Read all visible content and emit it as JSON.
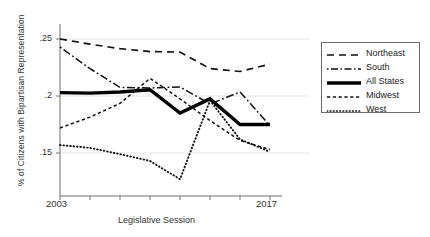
{
  "chart_data": {
    "type": "line",
    "title": "",
    "xlabel": "Legislative Session",
    "ylabel": "% of Citizens with Bipartisan Representation",
    "x": [
      2003,
      2005,
      2007,
      2009,
      2011,
      2013,
      2015,
      2017
    ],
    "xtick_labels": {
      "first": "2003",
      "last": "2017"
    },
    "ytick_labels": [
      ".25",
      ".2",
      ".15"
    ],
    "ytick_values": [
      0.25,
      0.2,
      0.15
    ],
    "ylim": [
      0.118,
      0.262
    ],
    "xlim": [
      2003,
      2017
    ],
    "grid": "horizontal-faint",
    "legend_position": "right-outside",
    "series": [
      {
        "name": "Northeast",
        "style": "dashed",
        "color": "#111111",
        "values": [
          0.25,
          0.2455,
          0.2415,
          0.239,
          0.2385,
          0.224,
          0.2215,
          0.228
        ]
      },
      {
        "name": "South",
        "style": "dash-dot",
        "color": "#111111",
        "values": [
          0.243,
          0.224,
          0.2075,
          0.207,
          0.208,
          0.193,
          0.2035,
          0.174
        ]
      },
      {
        "name": "All States",
        "style": "solid-thick",
        "color": "#000000",
        "values": [
          0.203,
          0.2025,
          0.2035,
          0.2055,
          0.185,
          0.1975,
          0.175,
          0.175
        ]
      },
      {
        "name": "Midwest",
        "style": "fine-dashed",
        "color": "#111111",
        "values": [
          0.172,
          0.1815,
          0.1935,
          0.2155,
          0.1975,
          0.1785,
          0.161,
          0.153
        ]
      },
      {
        "name": "West",
        "style": "dotted",
        "color": "#111111",
        "values": [
          0.157,
          0.1545,
          0.149,
          0.143,
          0.127,
          0.196,
          0.162,
          0.151
        ]
      }
    ]
  },
  "legend": {
    "entries": [
      {
        "label": "Northeast"
      },
      {
        "label": "South"
      },
      {
        "label": "All States"
      },
      {
        "label": "Midwest"
      },
      {
        "label": "West"
      }
    ]
  }
}
